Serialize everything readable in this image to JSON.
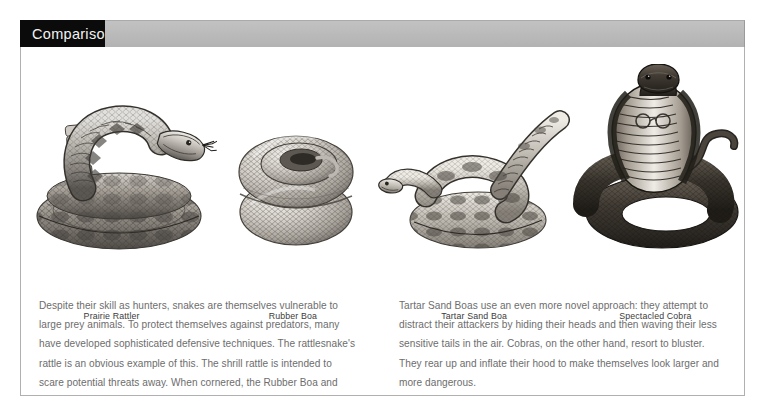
{
  "header": {
    "title": "Comparisons",
    "title_box_color": "#0b0b0b",
    "band_color": "#bbbbbb",
    "title_text_color": "#f2f2f2"
  },
  "panel": {
    "border_color": "#b0b0b0",
    "background": "#ffffff"
  },
  "figures": [
    {
      "id": "prairie-rattler",
      "caption": "Prairie Rattler",
      "illustration": "coiled-rattlesnake-engraving"
    },
    {
      "id": "rubber-boa",
      "caption": "Rubber Boa",
      "illustration": "coiled-ball-snake-engraving"
    },
    {
      "id": "tartar-sand-boa",
      "caption": "Tartar Sand Boa",
      "illustration": "sand-boa-raised-tail-engraving"
    },
    {
      "id": "spectacled-cobra",
      "caption": "Spectacled Cobra",
      "illustration": "rearing-cobra-hood-engraving"
    }
  ],
  "body": {
    "text_color": "#6d6d6d",
    "left_column": "Despite their skill as hunters, snakes are themselves vulnerable to large prey animals. To protect themselves against predators, many have developed sophisticated defensive techniques. The rattlesnake's rattle is an obvious example of this. The shrill rattle is intended to scare potential threats away. When cornered, the Rubber Boa and",
    "right_column": "Tartar Sand Boas use an even more novel approach: they attempt to distract their attackers by hiding their heads and then waving their less sensitive tails in the air. Cobras, on the other hand, resort to bluster. They rear up and inflate their hood to make themselves look larger and more dangerous."
  }
}
